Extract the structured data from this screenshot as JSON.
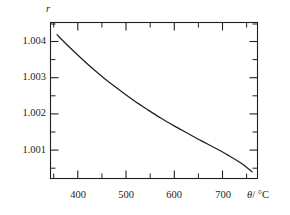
{
  "chart_data": {
    "type": "line",
    "title": "",
    "subtitle": "",
    "xlabel": "θ / °C",
    "ylabel": "r",
    "xlabel_symbol": "θ",
    "xlabel_unit": "/ °C",
    "ylabel_symbol": "r",
    "xlim": [
      345,
      730
    ],
    "ylim": [
      1.00055,
      1.00455
    ],
    "grid": false,
    "legend": null,
    "x_ticks_major": [
      400,
      500,
      600,
      700
    ],
    "x_ticks_major_labels": [
      "400",
      "500",
      "600",
      "700"
    ],
    "x_ticks_minor": [
      350,
      450,
      550,
      650,
      700
    ],
    "y_ticks_major": [
      1.001,
      1.002,
      1.003,
      1.004
    ],
    "y_ticks_major_labels": [
      "1.001",
      "1.002",
      "1.003",
      "1.004"
    ],
    "y_ticks_minor": [
      1.0015,
      1.0025,
      1.0035,
      1.0045
    ],
    "tick_direction": "in",
    "frame": "box",
    "series": [
      {
        "name": "r",
        "x": [
          357,
          380,
          400,
          425,
          450,
          475,
          500,
          525,
          550,
          575,
          600,
          625,
          650,
          675,
          700,
          720
        ],
        "y": [
          1.00424,
          1.00392,
          1.00366,
          1.00335,
          1.00306,
          1.0028,
          1.00255,
          1.00232,
          1.0021,
          1.0019,
          1.00171,
          1.00152,
          1.00134,
          1.00115,
          1.00094,
          1.00072
        ]
      }
    ],
    "colors": {
      "curve": "#231f20",
      "axis": "#231f20",
      "background": "#ffffff"
    }
  },
  "figure": {
    "y_axis_symbol": "r",
    "x_axis_text": "θ / °C"
  }
}
